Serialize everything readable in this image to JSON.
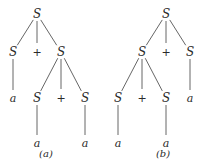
{
  "trees": [
    {
      "caption": "(a)",
      "nodes": [
        {
          "id": "a0",
          "label": "S",
          "kind": "node"
        },
        {
          "id": "a1",
          "label": "S",
          "kind": "node"
        },
        {
          "id": "a2",
          "label": "+",
          "kind": "op"
        },
        {
          "id": "a3",
          "label": "S",
          "kind": "node"
        },
        {
          "id": "a4",
          "label": "a",
          "kind": "term"
        },
        {
          "id": "a5",
          "label": "S",
          "kind": "node"
        },
        {
          "id": "a6",
          "label": "+",
          "kind": "op"
        },
        {
          "id": "a7",
          "label": "S",
          "kind": "node"
        },
        {
          "id": "a8",
          "label": "a",
          "kind": "term"
        },
        {
          "id": "a9",
          "label": "a",
          "kind": "term"
        }
      ],
      "edges": [
        [
          "a0",
          "a1"
        ],
        [
          "a0",
          "a2"
        ],
        [
          "a0",
          "a3"
        ],
        [
          "a1",
          "a4"
        ],
        [
          "a3",
          "a5"
        ],
        [
          "a3",
          "a6"
        ],
        [
          "a3",
          "a7"
        ],
        [
          "a5",
          "a8"
        ],
        [
          "a7",
          "a9"
        ]
      ]
    },
    {
      "caption": "(b)",
      "nodes": [
        {
          "id": "b0",
          "label": "S",
          "kind": "node"
        },
        {
          "id": "b1",
          "label": "S",
          "kind": "node"
        },
        {
          "id": "b2",
          "label": "+",
          "kind": "op"
        },
        {
          "id": "b3",
          "label": "S",
          "kind": "node"
        },
        {
          "id": "b4",
          "label": "S",
          "kind": "node"
        },
        {
          "id": "b5",
          "label": "+",
          "kind": "op"
        },
        {
          "id": "b6",
          "label": "S",
          "kind": "node"
        },
        {
          "id": "b7",
          "label": "a",
          "kind": "term"
        },
        {
          "id": "b8",
          "label": "a",
          "kind": "term"
        },
        {
          "id": "b9",
          "label": "a",
          "kind": "term"
        }
      ],
      "edges": [
        [
          "b0",
          "b1"
        ],
        [
          "b0",
          "b2"
        ],
        [
          "b0",
          "b3"
        ],
        [
          "b1",
          "b4"
        ],
        [
          "b1",
          "b5"
        ],
        [
          "b1",
          "b6"
        ],
        [
          "b3",
          "b7"
        ],
        [
          "b4",
          "b8"
        ],
        [
          "b6",
          "b9"
        ]
      ]
    }
  ]
}
